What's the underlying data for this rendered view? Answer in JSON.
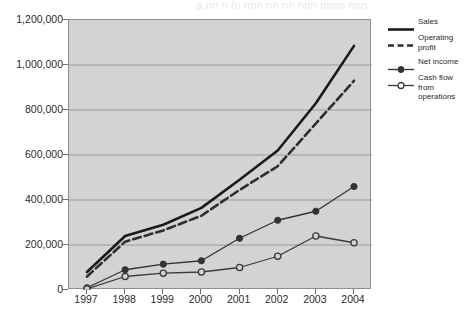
{
  "bleed_text": {
    "fragment_left": "·",
    "fragment_right": "a   nn   n   fn  nnn   nn  nn  nnn nnnn nnn"
  },
  "chart_data": {
    "type": "line",
    "title": "",
    "subtitle": "",
    "xlabel": "",
    "ylabel": "",
    "x": [
      "1997",
      "1998",
      "1999",
      "2000",
      "2001",
      "2002",
      "2003",
      "2004"
    ],
    "categories": [
      "1997",
      "1998",
      "1999",
      "2000",
      "2001",
      "2002",
      "2003",
      "2004"
    ],
    "ylim": [
      0,
      1200000
    ],
    "yticks": [
      0,
      200000,
      400000,
      600000,
      800000,
      1000000,
      1200000
    ],
    "ytick_labels": [
      "0",
      "200,000",
      "400,000",
      "600,000",
      "800,000",
      "1,000,000",
      "1,200,000"
    ],
    "xtick_labels": [
      "1997",
      "1998",
      "1999",
      "2000",
      "2001",
      "2002",
      "2003",
      "2004"
    ],
    "grid": true,
    "grid_axis": "y",
    "legend_position": "right",
    "plot_background": "#d3d3d3",
    "figure_background": "#ffffff",
    "line_color": "#262626",
    "grid_color": "#9a9a9a",
    "axis_color": "#8e8e8e",
    "series": [
      {
        "name": "Sales",
        "style": "solid-thick",
        "marker": "none",
        "color": "#1a1a1a",
        "values": [
          80000,
          240000,
          290000,
          365000,
          490000,
          620000,
          830000,
          1085000
        ]
      },
      {
        "name": "Operating profit",
        "style": "dashed-thick",
        "marker": "none",
        "color": "#2e2e2e",
        "values": [
          60000,
          215000,
          265000,
          330000,
          445000,
          550000,
          740000,
          930000
        ]
      },
      {
        "name": "Net income",
        "style": "solid-thin",
        "marker": "filled-circle",
        "color": "#333333",
        "values": [
          10000,
          90000,
          115000,
          130000,
          230000,
          310000,
          350000,
          460000
        ]
      },
      {
        "name": "Cash flow from operations",
        "style": "solid-thin",
        "marker": "open-circle",
        "color": "#3a3a3a",
        "values": [
          5000,
          60000,
          75000,
          80000,
          100000,
          150000,
          240000,
          210000
        ]
      }
    ]
  },
  "legend": {
    "entries": [
      {
        "label": "Sales"
      },
      {
        "label": "Operating profit"
      },
      {
        "label": "Net income"
      },
      {
        "label": "Cash flow from operations"
      }
    ]
  }
}
